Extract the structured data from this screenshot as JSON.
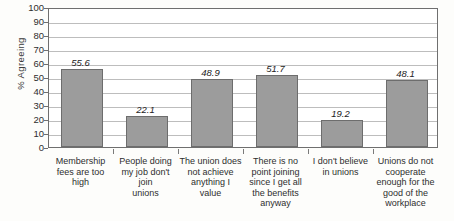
{
  "chart_data": {
    "type": "bar",
    "title": "",
    "xlabel": "",
    "ylabel": "% Agreeing",
    "ylim": [
      0,
      100
    ],
    "ytick_step": 10,
    "yticks": [
      100,
      90,
      80,
      70,
      60,
      50,
      40,
      30,
      20,
      10,
      0
    ],
    "grid": true,
    "legend": "none",
    "bar_color": "#9c9c9c",
    "bar_border_color": "#6d6d6d",
    "categories": [
      "Membership fees are too high",
      "People doing my job don't join unions",
      "The union does not achieve anything I value",
      "There is no point joining since I get all the benefits anyway",
      "I don't believe in unions",
      "Unions do not cooperate enough for the good of the workplace"
    ],
    "category_lines": [
      [
        "Membership",
        "fees are too",
        "high"
      ],
      [
        "People doing",
        "my job don't join",
        "unions"
      ],
      [
        "The union does",
        "not achieve",
        "anything I value"
      ],
      [
        "There is no",
        "point joining",
        "since I get all",
        "the benefits",
        "anyway"
      ],
      [
        "I don't believe",
        "in unions"
      ],
      [
        "Unions do not",
        "cooperate",
        "enough for the",
        "good of the",
        "workplace"
      ]
    ],
    "values": [
      55.6,
      22.1,
      48.9,
      51.7,
      19.2,
      48.1
    ],
    "value_labels": [
      "55.6",
      "22.1",
      "48.9",
      "51.7",
      "19.2",
      "48.1"
    ]
  }
}
